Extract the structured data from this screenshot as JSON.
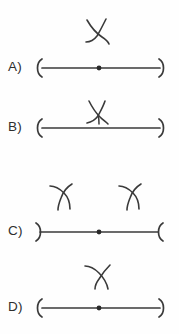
{
  "figure": {
    "kind": "multiple-choice-geometry-diagram",
    "background_color": "#fefefe",
    "ink_color": "#3a3a3a",
    "label_color": "#2e2e2e",
    "width": 179,
    "height": 334
  },
  "choices": [
    {
      "label": "A)",
      "name": "choice-a",
      "left_endpoint": "open-paren-bracket",
      "right_endpoint": "close-paren-bracket",
      "has_center_dot": true,
      "marks": [
        {
          "name": "x-mark-above-center",
          "position": "above-center",
          "x": 96,
          "y": 30
        }
      ]
    },
    {
      "label": "B)",
      "name": "choice-b",
      "left_endpoint": "open-paren-bracket",
      "right_endpoint": "close-paren-bracket",
      "has_center_dot": false,
      "marks": [
        {
          "name": "x-mark-on-line-center",
          "position": "on-line-center",
          "x": 96,
          "y": 124
        }
      ]
    },
    {
      "label": "C)",
      "name": "choice-c",
      "left_endpoint": "close-paren-bracket",
      "right_endpoint": "open-paren-bracket",
      "has_center_dot": true,
      "marks": [
        {
          "name": "x-mark-above-left",
          "position": "above-left",
          "x": 62,
          "y": 195
        },
        {
          "name": "x-mark-above-right",
          "position": "above-right",
          "x": 131,
          "y": 195
        }
      ]
    },
    {
      "label": "D)",
      "name": "choice-d",
      "left_endpoint": "open-paren-bracket",
      "right_endpoint": "close-paren-bracket",
      "has_center_dot": true,
      "marks": [
        {
          "name": "x-mark-above-center",
          "position": "above-center",
          "x": 98,
          "y": 270
        }
      ]
    }
  ],
  "geometry": {
    "line_start_x": 40,
    "line_end_x": 162,
    "center_dot_x": 99,
    "stroke_width": 1.7
  }
}
